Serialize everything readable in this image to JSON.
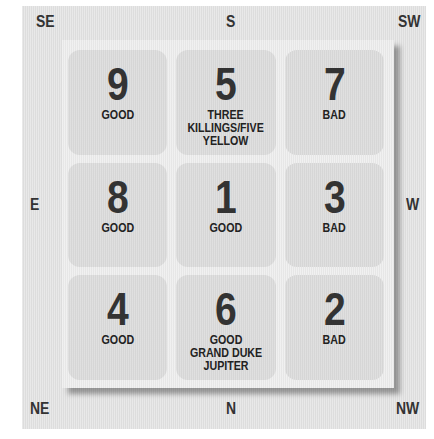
{
  "directions": {
    "top_left": "SE",
    "top_center": "S",
    "top_right": "SW",
    "middle_left": "E",
    "middle_right": "W",
    "bottom_left": "NE",
    "bottom_center": "N",
    "bottom_right": "NW"
  },
  "grid": [
    {
      "position": "SE",
      "number": "9",
      "label": "GOOD"
    },
    {
      "position": "S",
      "number": "5",
      "label": "THREE\nKILLINGS/FIVE\nYELLOW"
    },
    {
      "position": "SW",
      "number": "7",
      "label": "BAD"
    },
    {
      "position": "E",
      "number": "8",
      "label": "GOOD"
    },
    {
      "position": "CENTER",
      "number": "1",
      "label": "GOOD"
    },
    {
      "position": "W",
      "number": "3",
      "label": "BAD"
    },
    {
      "position": "NE",
      "number": "4",
      "label": "GOOD"
    },
    {
      "position": "N",
      "number": "6",
      "label": "GOOD\nGRAND DUKE\nJUPITER"
    },
    {
      "position": "NW",
      "number": "2",
      "label": "BAD"
    }
  ],
  "colors": {
    "panel": "#e4e4e4",
    "board": "#ececec",
    "cell": "#dadada",
    "text": "#333333"
  }
}
